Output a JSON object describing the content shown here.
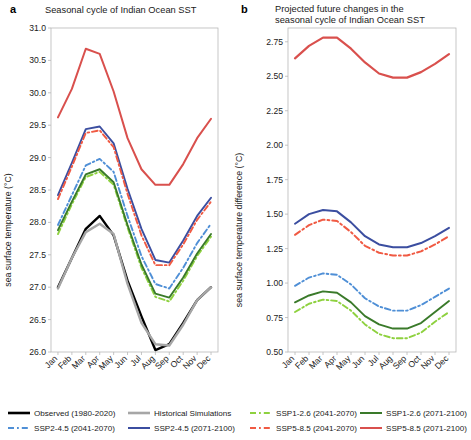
{
  "figure": {
    "width": 471,
    "height": 440
  },
  "panels": [
    {
      "letter": "a",
      "title_lines": [
        "Seasonal cycle of Indian Ocean SST"
      ],
      "ylabel": "sea surface temperature (°C)"
    },
    {
      "letter": "b",
      "title_lines": [
        "Projected future changes in the",
        "seasonal cycle of Indian Ocean SST"
      ],
      "ylabel": "sea surface temperature difference (°C)"
    }
  ],
  "legend": {
    "entries": [
      {
        "label": "Observed (1980-2020)",
        "color": "#000000",
        "dash": "solid",
        "width": 2.6
      },
      {
        "label": "Historical Simulations",
        "color": "#a6a6a6",
        "dash": "solid",
        "width": 2.6
      },
      {
        "label": "SSP1-2.6 (2041-2070)",
        "color": "#8ed13f",
        "dash": "dashdot",
        "width": 2.0
      },
      {
        "label": "SSP1-2.6 (2071-2100)",
        "color": "#3a7a2a",
        "dash": "solid",
        "width": 2.0
      },
      {
        "label": "SSP2-4.5 (2041-2070)",
        "color": "#4f8fd6",
        "dash": "dashdot",
        "width": 2.0
      },
      {
        "label": "SSP2-4.5 (2071-2100)",
        "color": "#3b4ea0",
        "dash": "solid",
        "width": 2.0
      },
      {
        "label": "SSP5-8.5 (2041-2070)",
        "color": "#f05a43",
        "dash": "dashdot",
        "width": 2.0
      },
      {
        "label": "SSP5-8.5 (2071-2100)",
        "color": "#d9504d",
        "dash": "solid",
        "width": 2.0
      }
    ]
  },
  "chart_data": [
    {
      "type": "line",
      "panel": "a",
      "title": "Seasonal cycle of Indian Ocean SST",
      "xlabel": "",
      "ylabel": "sea surface temperature (°C)",
      "x": [
        "Jan",
        "Feb",
        "Mar",
        "Apr",
        "May",
        "Jun",
        "Jul",
        "Aug",
        "Sep",
        "Oct",
        "Nov",
        "Dec"
      ],
      "ylim": [
        26.0,
        31.0
      ],
      "yticks": [
        26.0,
        26.5,
        27.0,
        27.5,
        28.0,
        28.5,
        29.0,
        29.5,
        30.0,
        30.5,
        31.0
      ],
      "ytick_labels": [
        "26.0",
        "26.5",
        "27.0",
        "27.5",
        "28.0",
        "28.5",
        "29.0",
        "29.5",
        "30.0",
        "30.5",
        "31.0"
      ],
      "grid": false,
      "legend_position": "below-figure",
      "series": [
        {
          "name": "Observed (1980-2020)",
          "color": "#000000",
          "dash": "solid",
          "width": 2.4,
          "values": [
            27.0,
            27.45,
            27.9,
            28.1,
            27.8,
            27.1,
            26.55,
            26.03,
            26.12,
            26.45,
            26.8,
            27.0
          ]
        },
        {
          "name": "Historical Simulations",
          "color": "#a6a6a6",
          "dash": "solid",
          "width": 2.4,
          "values": [
            26.98,
            27.45,
            27.85,
            27.98,
            27.82,
            27.05,
            26.45,
            26.12,
            26.1,
            26.42,
            26.8,
            27.0
          ]
        },
        {
          "name": "SSP1-2.6 (2041-2070)",
          "color": "#8ed13f",
          "dash": "dashdot",
          "width": 1.9,
          "values": [
            27.82,
            28.28,
            28.7,
            28.78,
            28.58,
            27.92,
            27.3,
            26.85,
            26.78,
            27.1,
            27.48,
            27.78
          ]
        },
        {
          "name": "SSP1-2.6 (2071-2100)",
          "color": "#3a7a2a",
          "dash": "solid",
          "width": 1.9,
          "values": [
            27.88,
            28.32,
            28.74,
            28.82,
            28.62,
            27.96,
            27.35,
            26.9,
            26.84,
            27.15,
            27.52,
            27.82
          ]
        },
        {
          "name": "SSP2-4.5 (2041-2070)",
          "color": "#4f8fd6",
          "dash": "dashdot",
          "width": 1.9,
          "values": [
            27.96,
            28.42,
            28.88,
            28.98,
            28.78,
            28.1,
            27.48,
            27.05,
            26.98,
            27.3,
            27.68,
            27.98
          ]
        },
        {
          "name": "SSP2-4.5 (2071-2100)",
          "color": "#3b4ea0",
          "dash": "solid",
          "width": 1.9,
          "values": [
            28.42,
            28.92,
            29.44,
            29.48,
            29.22,
            28.52,
            27.9,
            27.42,
            27.38,
            27.72,
            28.1,
            28.38
          ]
        },
        {
          "name": "SSP5-8.5 (2041-2070)",
          "color": "#f05a43",
          "dash": "dashdot",
          "width": 1.9,
          "values": [
            28.36,
            28.86,
            29.38,
            29.42,
            29.16,
            28.44,
            27.8,
            27.34,
            27.34,
            27.66,
            28.04,
            28.32
          ]
        },
        {
          "name": "SSP5-8.5 (2071-2100)",
          "color": "#d9504d",
          "dash": "solid",
          "width": 2.0,
          "values": [
            29.62,
            30.06,
            30.68,
            30.6,
            30.02,
            29.3,
            28.82,
            28.58,
            28.58,
            28.9,
            29.3,
            29.6
          ]
        }
      ]
    },
    {
      "type": "line",
      "panel": "b",
      "title": "Projected future changes in the seasonal cycle of Indian Ocean SST",
      "xlabel": "",
      "ylabel": "sea surface temperature difference (°C)",
      "x": [
        "Jan",
        "Feb",
        "Mar",
        "Apr",
        "May",
        "Jun",
        "Jul",
        "Aug",
        "Sep",
        "Oct",
        "Nov",
        "Dec"
      ],
      "ylim": [
        0.5,
        2.85
      ],
      "yticks": [
        0.5,
        0.75,
        1.0,
        1.25,
        1.5,
        1.75,
        2.0,
        2.25,
        2.5,
        2.75
      ],
      "ytick_labels": [
        "0.50",
        "0.75",
        "1.00",
        "1.25",
        "1.50",
        "1.75",
        "2.00",
        "2.25",
        "2.50",
        "2.75"
      ],
      "grid": false,
      "legend_position": "below-figure",
      "series": [
        {
          "name": "SSP1-2.6 (2041-2070)",
          "color": "#8ed13f",
          "dash": "dashdot",
          "width": 1.9,
          "values": [
            0.79,
            0.85,
            0.88,
            0.87,
            0.8,
            0.7,
            0.63,
            0.6,
            0.6,
            0.64,
            0.72,
            0.79
          ]
        },
        {
          "name": "SSP1-2.6 (2071-2100)",
          "color": "#3a7a2a",
          "dash": "solid",
          "width": 1.9,
          "values": [
            0.86,
            0.91,
            0.94,
            0.93,
            0.86,
            0.76,
            0.7,
            0.67,
            0.67,
            0.71,
            0.79,
            0.87
          ]
        },
        {
          "name": "SSP2-4.5 (2041-2070)",
          "color": "#4f8fd6",
          "dash": "dashdot",
          "width": 1.9,
          "values": [
            0.98,
            1.04,
            1.07,
            1.06,
            0.99,
            0.89,
            0.83,
            0.8,
            0.8,
            0.84,
            0.9,
            0.96
          ]
        },
        {
          "name": "SSP2-4.5 (2071-2100)",
          "color": "#3b4ea0",
          "dash": "solid",
          "width": 2.0,
          "values": [
            1.43,
            1.5,
            1.53,
            1.52,
            1.44,
            1.34,
            1.28,
            1.26,
            1.26,
            1.29,
            1.34,
            1.4
          ]
        },
        {
          "name": "SSP5-8.5 (2041-2070)",
          "color": "#f05a43",
          "dash": "dashdot",
          "width": 2.0,
          "values": [
            1.35,
            1.42,
            1.46,
            1.45,
            1.37,
            1.27,
            1.22,
            1.2,
            1.2,
            1.23,
            1.28,
            1.34
          ]
        },
        {
          "name": "SSP5-8.5 (2071-2100)",
          "color": "#d9504d",
          "dash": "solid",
          "width": 2.2,
          "values": [
            2.63,
            2.72,
            2.78,
            2.78,
            2.7,
            2.6,
            2.52,
            2.49,
            2.49,
            2.53,
            2.59,
            2.66
          ]
        }
      ]
    }
  ]
}
